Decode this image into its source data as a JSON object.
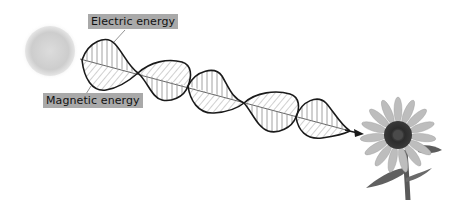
{
  "diagram": {
    "type": "electromagnetic-wave-illustration",
    "labels": {
      "electric": "Electric energy",
      "magnetic": "Magnetic energy"
    },
    "elements": {
      "source": "sun",
      "target": "sunflower",
      "wave": "electromagnetic wave with electric (vertical hatched) and magnetic (diagonal hatched) components",
      "arrow_direction": "toward sunflower"
    },
    "colors": {
      "label_bg": "#a9a9a9",
      "wave_stroke": "#1a1a1a",
      "hatch": "#8a8a8a",
      "sun": "#cfcfcf"
    }
  }
}
